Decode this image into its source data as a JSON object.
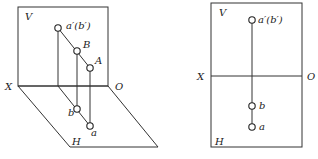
{
  "figure_left": {
    "title": "Pictorial projection",
    "labels": {
      "V": "V",
      "H": "H",
      "X": "X",
      "O": "O",
      "a_prime_b_prime": "a′(b′)",
      "B": "B",
      "A": "A",
      "b": "b",
      "a": "a"
    }
  },
  "figure_right": {
    "title": "Orthographic projection",
    "labels": {
      "V": "V",
      "H": "H",
      "X": "X",
      "O": "O",
      "a_prime_b_prime": "a′(b′)",
      "b": "b",
      "a": "a"
    }
  },
  "colors": {
    "line": "#333333",
    "text": "#222222",
    "background": "#ffffff"
  }
}
